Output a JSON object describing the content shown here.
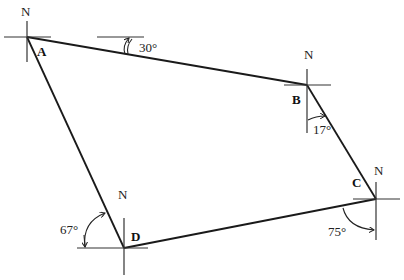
{
  "diagram": {
    "vertices": [
      {
        "id": "A",
        "label": "A",
        "north": "N"
      },
      {
        "id": "B",
        "label": "B",
        "north": "N"
      },
      {
        "id": "C",
        "label": "C",
        "north": "N"
      },
      {
        "id": "D",
        "label": "D",
        "north": "N"
      }
    ],
    "edges": [
      {
        "from": "A",
        "to": "B"
      },
      {
        "from": "B",
        "to": "C"
      },
      {
        "from": "C",
        "to": "D"
      },
      {
        "from": "D",
        "to": "A"
      }
    ],
    "angles": [
      {
        "id": "ab",
        "label": "30°",
        "value": 30,
        "at": "line AB"
      },
      {
        "id": "b",
        "label": "17°",
        "value": 17,
        "at": "B"
      },
      {
        "id": "c",
        "label": "75°",
        "value": 75,
        "at": "C"
      },
      {
        "id": "d",
        "label": "67°",
        "value": 67,
        "at": "D"
      }
    ],
    "colors": {
      "line": "#1a1a1a",
      "background": "#ffffff"
    }
  }
}
